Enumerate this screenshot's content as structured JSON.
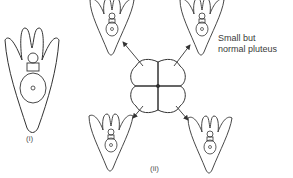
{
  "figure": {
    "panels": [
      {
        "id": "i",
        "label": "(i)",
        "description": "Single normal pluteus larva"
      },
      {
        "id": "ii",
        "label": "(ii)",
        "description": "4-cell embryo separated into blastomeres, each giving rise to a larva"
      }
    ],
    "annotation": {
      "line1": "Small but",
      "line2": "normal pluteus"
    },
    "colors": {
      "stroke": "#333333",
      "background": "#ffffff"
    }
  }
}
